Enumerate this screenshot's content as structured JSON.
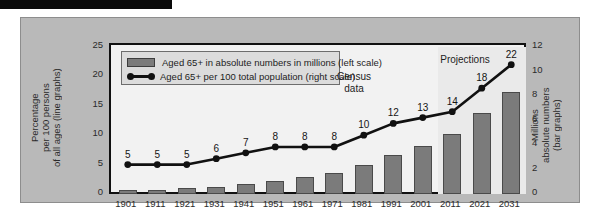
{
  "chart_data": {
    "type": "bar",
    "title": "",
    "categories": [
      "1901",
      "1911",
      "1921",
      "1931",
      "1941",
      "1951",
      "1961",
      "1971",
      "1981",
      "1991",
      "2001",
      "2011",
      "2021",
      "2031"
    ],
    "series": [
      {
        "name": "Aged 65+ in absolute numbers in millions (left scale)",
        "type": "bar",
        "axis": "right",
        "unit": "millions",
        "values": [
          0.3,
          0.35,
          0.45,
          0.6,
          0.85,
          1.1,
          1.4,
          1.75,
          2.4,
          3.2,
          3.9,
          4.9,
          6.6,
          8.3
        ]
      },
      {
        "name": "Aged 65+ per 100 total population (right scale)",
        "type": "line",
        "axis": "left",
        "unit": "percent",
        "values": [
          5,
          5,
          5,
          6,
          7,
          8,
          8,
          8,
          10,
          12,
          13,
          14,
          18,
          22
        ],
        "point_labels": [
          "5",
          "5",
          "5",
          "6",
          "7",
          "8",
          "8",
          "8",
          "10",
          "12",
          "13",
          "14",
          "18",
          "22"
        ]
      }
    ],
    "left_axis": {
      "label": "Percentage\nper 100 persons\nof all ages (line graphs)",
      "ticks": [
        0,
        5,
        10,
        15,
        20,
        25
      ],
      "range": [
        0,
        25
      ]
    },
    "right_axis": {
      "label": "Millions\nabsolute numbers\n(bar graphs)",
      "ticks": [
        0,
        2,
        4,
        6,
        8,
        10,
        12
      ],
      "range": [
        0,
        12
      ]
    },
    "xlabel": "",
    "grid": false,
    "legend_position": "top-left",
    "annotations": [
      {
        "text": "Census\ndata",
        "near": "1991-2001"
      },
      {
        "text": "Projections",
        "near": "2011-2031"
      }
    ],
    "projection_starts_at": "2011"
  },
  "legend": {
    "items": [
      {
        "marker": "bar-swatch",
        "label": "Aged 65+ in absolute numbers in millions (left scale)"
      },
      {
        "marker": "line-marker",
        "label": "Aged 65+ per 100 total population (right scale)"
      }
    ]
  },
  "annotations": {
    "census": "Census\ndata",
    "projections": "Projections"
  },
  "axes": {
    "left_title": "Percentage\nper 100 persons\nof all ages (line graphs)",
    "right_title": "Millions\nabsolute numbers\n(bar graphs)",
    "left_ticks": [
      "25",
      "20",
      "15",
      "10",
      "5",
      "0"
    ],
    "right_ticks": [
      "12",
      "10",
      "8",
      "6",
      "4",
      "2",
      "0"
    ]
  },
  "colors": {
    "panel": "#b9b9b9",
    "plot_bg": "#f2f2f2",
    "projection_bg": "#eaeaea",
    "bar_fill": "#7b7b7b",
    "line": "#111111",
    "axis": "#111111"
  }
}
